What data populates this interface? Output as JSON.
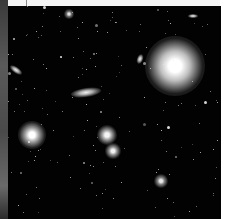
{
  "image": {
    "subject": "deep-field galaxy cluster",
    "background_color": "#020202",
    "objects": [
      {
        "name": "bright-star",
        "x": 175,
        "y": 66,
        "r": 30,
        "core": "#ffffff",
        "glow": "#bdbdbd"
      },
      {
        "name": "elliptical-galaxy-left",
        "x": 32,
        "y": 135,
        "r": 14,
        "core": "#ffffff",
        "glow": "#a0a0a0"
      },
      {
        "name": "elliptical-galaxy-center-a",
        "x": 107,
        "y": 135,
        "r": 10,
        "core": "#f4f4f4",
        "glow": "#9a9a9a"
      },
      {
        "name": "elliptical-galaxy-center-b",
        "x": 113,
        "y": 151,
        "r": 8,
        "core": "#f0f0f0",
        "glow": "#909090"
      },
      {
        "name": "galaxy-lower-right",
        "x": 161,
        "y": 181,
        "r": 7,
        "core": "#e6e6e6",
        "glow": "#808080"
      },
      {
        "name": "galaxy-top",
        "x": 69,
        "y": 14,
        "r": 5,
        "core": "#e0e0e0",
        "glow": "#707070"
      }
    ],
    "spirals": [
      {
        "name": "edge-on-spiral",
        "x": 86,
        "y": 92,
        "w": 30,
        "h": 9,
        "rot": -8
      },
      {
        "name": "tilted-spiral-left",
        "x": 16,
        "y": 70,
        "w": 14,
        "h": 6,
        "rot": 35
      },
      {
        "name": "small-spiral-top-right",
        "x": 193,
        "y": 16,
        "w": 10,
        "h": 4,
        "rot": 0
      },
      {
        "name": "small-spiral-mid",
        "x": 140,
        "y": 59,
        "w": 6,
        "h": 10,
        "rot": 20
      }
    ]
  }
}
